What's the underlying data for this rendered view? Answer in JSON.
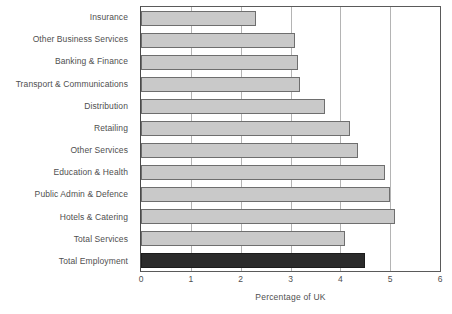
{
  "chart_data": {
    "type": "bar",
    "orientation": "horizontal",
    "title": "",
    "xlabel": "Percentage of UK",
    "ylabel": "",
    "xlim": [
      0,
      6
    ],
    "xticks": [
      0,
      1,
      2,
      3,
      4,
      5,
      6
    ],
    "xtick_labels": [
      "0",
      "1",
      "2",
      "3",
      "4",
      "5",
      "6"
    ],
    "grid": true,
    "grid_axis": "x",
    "legend": "none",
    "categories": [
      "Insurance",
      "Other Business Services",
      "Banking & Finance",
      "Transport & Communications",
      "Distribution",
      "Retailing",
      "Other Services",
      "Education & Health",
      "Public Admin & Defence",
      "Hotels & Catering",
      "Total Services",
      "Total Employment"
    ],
    "values": [
      2.3,
      3.1,
      3.15,
      3.2,
      3.7,
      4.2,
      4.35,
      4.9,
      5.0,
      5.1,
      4.1,
      4.5
    ],
    "bar_colors": [
      "#c9c9c9",
      "#c9c9c9",
      "#c9c9c9",
      "#c9c9c9",
      "#c9c9c9",
      "#c9c9c9",
      "#c9c9c9",
      "#c9c9c9",
      "#c9c9c9",
      "#c9c9c9",
      "#c9c9c9",
      "#2b2b2b"
    ],
    "colors": {
      "bar_fill": "#c9c9c9",
      "bar_edge": "#6e6e6e",
      "highlight_fill": "#2b2b2b",
      "highlight_edge": "#1c1c1c",
      "gridline": "#b4b4b4",
      "axis": "#5a5a5a",
      "text": "#4f4f4f",
      "background": "#ffffff"
    }
  }
}
